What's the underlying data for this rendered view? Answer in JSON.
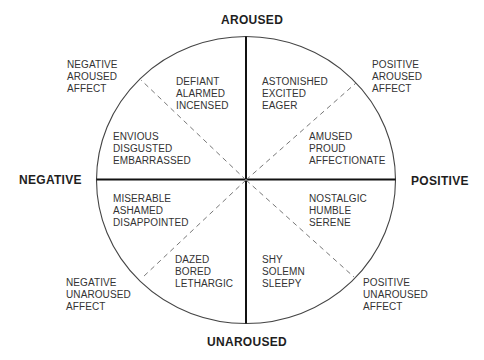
{
  "axes": {
    "top": "AROUSED",
    "bottom": "UNAROUSED",
    "left": "NEGATIVE",
    "right": "POSITIVE"
  },
  "corner_labels": {
    "top_left": [
      "NEGATIVE",
      "AROUSED",
      "AFFECT"
    ],
    "top_right": [
      "POSITIVE",
      "AROUSED",
      "AFFECT"
    ],
    "bottom_left": [
      "NEGATIVE",
      "UNAROUSED",
      "AFFECT"
    ],
    "bottom_right": [
      "POSITIVE",
      "UNAROUSED",
      "AFFECT"
    ]
  },
  "sectors": {
    "upper_left_outer": [
      "DEFIANT",
      "ALARMED",
      "INCENSED"
    ],
    "upper_left_inner": [
      "ENVIOUS",
      "DISGUSTED",
      "EMBARRASSED"
    ],
    "upper_right_outer": [
      "ASTONISHED",
      "EXCITED",
      "EAGER"
    ],
    "upper_right_inner": [
      "AMUSED",
      "PROUD",
      "AFFECTIONATE"
    ],
    "lower_left_inner": [
      "MISERABLE",
      "ASHAMED",
      "DISAPPOINTED"
    ],
    "lower_left_outer": [
      "DAZED",
      "BORED",
      "LETHARGIC"
    ],
    "lower_right_inner": [
      "NOSTALGIC",
      "HUMBLE",
      "SERENE"
    ],
    "lower_right_outer": [
      "SHY",
      "SOLEMN",
      "SLEEPY"
    ]
  },
  "colors": {
    "stroke": "#222222",
    "dash": "#777777",
    "text": "#333333"
  }
}
